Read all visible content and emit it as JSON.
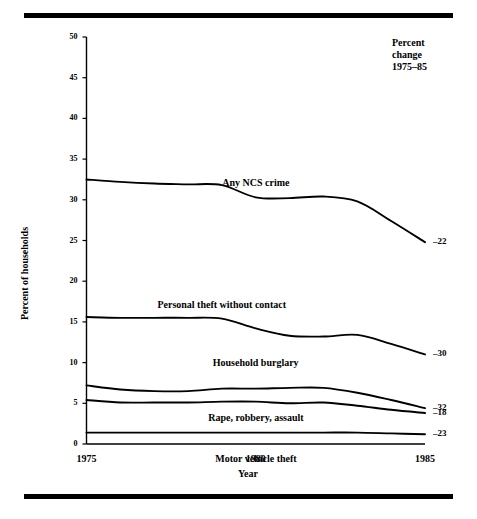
{
  "figure": {
    "y_axis_title": "Percent of households",
    "x_axis_title": "Year",
    "legend_header": {
      "line1": "Percent",
      "line2": "change",
      "line3": "1975–85"
    }
  },
  "chart_data": {
    "type": "line",
    "title": "",
    "subtitle": "",
    "xlabel": "Year",
    "ylabel": "Percent of households",
    "xlim": [
      1975,
      1985
    ],
    "ylim": [
      0,
      50
    ],
    "grid": false,
    "legend_position": "inline-labels",
    "x": [
      1975,
      1976,
      1977,
      1978,
      1979,
      1980,
      1981,
      1982,
      1983,
      1984,
      1985
    ],
    "xticks": [
      1975,
      1980,
      1985
    ],
    "xticklabels": [
      "1975",
      "1980",
      "1985"
    ],
    "yticks": [
      0,
      5,
      10,
      15,
      20,
      25,
      30,
      35,
      40,
      45,
      50
    ],
    "yticklabels": [
      "0",
      "5",
      "10",
      "15",
      "20",
      "25",
      "30",
      "35",
      "40",
      "45",
      "50"
    ],
    "annotation_header": "Percent change 1975–85",
    "series": [
      {
        "name": "Any NCS crime",
        "label": "Any NCS crime",
        "percent_change": "–22",
        "values": [
          32.5,
          32.2,
          32.0,
          31.9,
          31.8,
          30.3,
          30.2,
          30.4,
          29.8,
          27.4,
          24.8
        ]
      },
      {
        "name": "Personal theft without contact",
        "label": "Personal theft without contact",
        "percent_change": "–30",
        "values": [
          15.6,
          15.5,
          15.5,
          15.5,
          15.4,
          14.2,
          13.3,
          13.2,
          13.4,
          12.3,
          11.0
        ]
      },
      {
        "name": "Household burglary",
        "label": "Household burglary",
        "percent_change": "–32",
        "values": [
          7.2,
          6.7,
          6.5,
          6.5,
          6.8,
          6.8,
          6.9,
          6.9,
          6.3,
          5.4,
          4.4
        ]
      },
      {
        "name": "Rape, robbery, assault",
        "label": "Rape, robbery, assault",
        "percent_change": "–18",
        "values": [
          5.4,
          5.1,
          5.1,
          5.1,
          5.2,
          5.2,
          5.0,
          5.1,
          4.7,
          4.2,
          3.8
        ]
      },
      {
        "name": "Motor vehicle theft",
        "label": "Motor vehicle theft",
        "percent_change": "–23",
        "values": [
          1.4,
          1.4,
          1.4,
          1.4,
          1.4,
          1.4,
          1.4,
          1.4,
          1.4,
          1.3,
          1.2
        ]
      }
    ]
  }
}
